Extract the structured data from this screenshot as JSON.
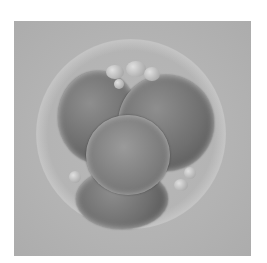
{
  "image": {
    "subject": "microscopy image of a cleavage-stage embryo",
    "colors": {
      "background": "#b5b5b5",
      "cells": "#6f6f6f",
      "page": "#ffffff"
    }
  }
}
